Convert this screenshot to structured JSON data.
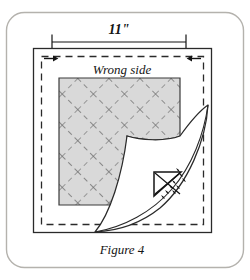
{
  "figure": {
    "caption": "Figure 4",
    "dimension_label": "11\"",
    "fabric_face_label": "Wrong side",
    "colors": {
      "ink": "#141414",
      "frame_border": "#b4b2ad",
      "quilt_fill": "#d9d9d9",
      "quilt_stitch": "#6f6f6f",
      "page_background": "#ffffff",
      "fold_underside": "#ffffff"
    },
    "elements": {
      "outer_frame": "rounded-illustration-frame",
      "fabric_outline": "solid-square-fabric-edge",
      "seam_allowance": "dashed-inner-seam-line",
      "quilted_block": "gray-crosshatch-quilted-panel",
      "folded_corner": "curled-back-corner-flap",
      "corner_stitch_detail": "mitered-corner-hand-stitch-detail",
      "dimension_line": "horizontal-measure-with-end-ticks",
      "arrow_left": "seam-allowance-arrow-pointing-right",
      "arrow_right": "seam-allowance-arrow-pointing-left"
    }
  }
}
